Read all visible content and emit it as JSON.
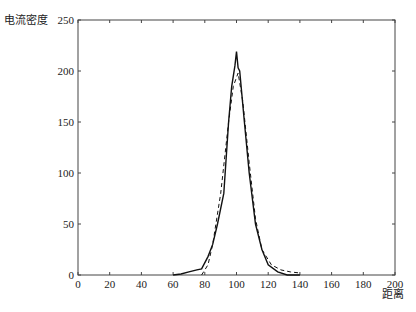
{
  "chart_data": {
    "type": "line",
    "title": "",
    "xlabel": "距离",
    "ylabel": "电流密度",
    "xlim": [
      0,
      200
    ],
    "ylim": [
      0,
      250
    ],
    "xticks": [
      0,
      20,
      40,
      60,
      80,
      100,
      120,
      140,
      160,
      180,
      200
    ],
    "yticks": [
      0,
      50,
      100,
      150,
      200,
      250
    ],
    "grid": false,
    "legend": null,
    "series": [
      {
        "name": "solid",
        "style": "solid",
        "x": [
          60,
          65,
          70,
          75,
          78,
          82,
          85,
          88,
          92,
          95,
          97,
          99,
          100,
          101,
          102,
          105,
          108,
          112,
          116,
          120,
          126,
          132,
          140
        ],
        "y": [
          0,
          1,
          3,
          5,
          6,
          18,
          30,
          50,
          80,
          150,
          185,
          205,
          219,
          203,
          200,
          150,
          100,
          50,
          25,
          10,
          3,
          0,
          0
        ]
      },
      {
        "name": "dashed",
        "style": "dashed",
        "x": [
          78,
          82,
          85,
          90,
          95,
          98,
          101,
          104,
          108,
          112,
          116,
          122,
          128,
          134,
          140
        ],
        "y": [
          0,
          10,
          30,
          80,
          150,
          185,
          198,
          170,
          110,
          55,
          25,
          10,
          5,
          3,
          2
        ]
      }
    ]
  }
}
